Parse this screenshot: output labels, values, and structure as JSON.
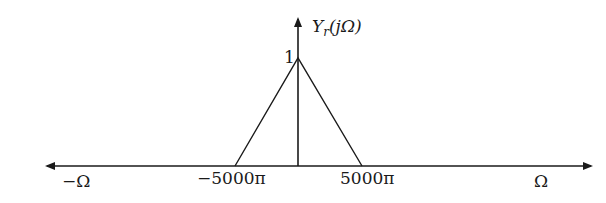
{
  "diagram": {
    "y_label_main": "Y",
    "y_label_sub": "r",
    "y_label_arg": "(jΩ)",
    "peak_label": "1",
    "x_ticks": [
      {
        "label": "−5000π",
        "value": "-5000π"
      },
      {
        "label": "5000π",
        "value": "5000π"
      }
    ],
    "x_left_label": "−Ω",
    "x_right_label": "Ω",
    "shape": "triangle",
    "peak_value": 1,
    "support": [
      "-5000π",
      "5000π"
    ],
    "line_color": "#1a1a1a"
  }
}
